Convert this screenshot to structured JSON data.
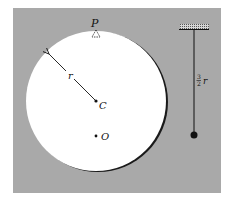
{
  "diagram": {
    "labels": {
      "pivot": "P",
      "center_of_mass": "C",
      "center": "O",
      "radius": "r",
      "pendulum_length_num": "3",
      "pendulum_length_den": "2",
      "pendulum_length_var": "r"
    },
    "colors": {
      "background_panel": "#a9a9a9",
      "disc": "#ffffff",
      "ink": "#111111"
    }
  }
}
